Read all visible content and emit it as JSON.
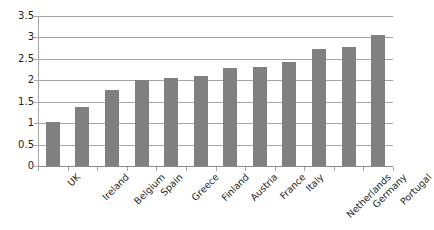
{
  "chart_data": {
    "type": "bar",
    "title": "",
    "subtitle": "",
    "xlabel": "",
    "ylabel": "",
    "categories": [
      "UK",
      "Ireland",
      "Belgium",
      "Spain",
      "Greece",
      "Finland",
      "Austria",
      "France",
      "Italy",
      "Netherlands",
      "Germany",
      "Portugal"
    ],
    "values": [
      1.02,
      1.38,
      1.78,
      2.0,
      2.06,
      2.1,
      2.29,
      2.31,
      2.42,
      2.73,
      2.77,
      3.06
    ],
    "ylim": [
      0,
      3.5
    ],
    "y_ticks": [
      "0",
      "0.5",
      "1",
      "1.5",
      "2",
      "2.5",
      "3",
      "3.5"
    ],
    "y_tick_values": [
      0,
      0.5,
      1,
      1.5,
      2,
      2.5,
      3,
      3.5
    ],
    "grid": true,
    "legend": false,
    "legend_position": "none",
    "series": [
      {
        "name": "",
        "color": "#808080",
        "values": [
          1.02,
          1.38,
          1.78,
          2.0,
          2.06,
          2.1,
          2.29,
          2.31,
          2.42,
          2.73,
          2.77,
          3.06
        ]
      }
    ],
    "colors": {
      "bar": "#808080",
      "gridline": "#a6a6a6",
      "axis": "#a6a6a6",
      "text": "#231f20",
      "background": "#ffffff"
    }
  }
}
